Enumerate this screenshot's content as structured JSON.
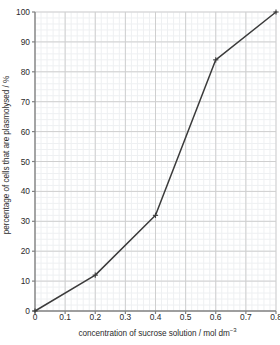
{
  "chart_data": {
    "type": "line",
    "title": "",
    "xlabel": "concentration of sucrose solution / mol dm⁻³",
    "xlabel_main": "concentration of sucrose solution / mol dm",
    "xlabel_sup": "−3",
    "ylabel": "percentage of cells that are plasmolysed / %",
    "x": [
      0,
      0.2,
      0.4,
      0.6,
      0.8
    ],
    "values": [
      0,
      12,
      32,
      84,
      100
    ],
    "series": [
      {
        "name": "percentage of cells that are plasmolysed",
        "points": [
          {
            "x": 0,
            "y": 0
          },
          {
            "x": 0.2,
            "y": 12
          },
          {
            "x": 0.4,
            "y": 32
          },
          {
            "x": 0.6,
            "y": 84
          },
          {
            "x": 0.8,
            "y": 100
          }
        ]
      }
    ],
    "xlim": [
      0,
      0.8
    ],
    "ylim": [
      0,
      100
    ],
    "xticks": [
      "0",
      "0.1",
      "0.2",
      "0.3",
      "0.4",
      "0.5",
      "0.6",
      "0.7",
      "0.8"
    ],
    "xtick_values": [
      0,
      0.1,
      0.2,
      0.3,
      0.4,
      0.5,
      0.6,
      0.7,
      0.8
    ],
    "yticks": [
      "0",
      "10",
      "20",
      "30",
      "40",
      "50",
      "60",
      "70",
      "80",
      "90",
      "100"
    ],
    "ytick_values": [
      0,
      10,
      20,
      30,
      40,
      50,
      60,
      70,
      80,
      90,
      100
    ],
    "grid": true,
    "minor_grid": true,
    "legend": "none",
    "marker": "cross",
    "colors": {
      "line": "#3b3b3b",
      "marker": "#3b3b3b",
      "axis": "#808080",
      "major_grid": "#cfcfcf",
      "minor_grid": "#eef0f2",
      "text": "#2b2b2b",
      "background": "#ffffff"
    }
  }
}
